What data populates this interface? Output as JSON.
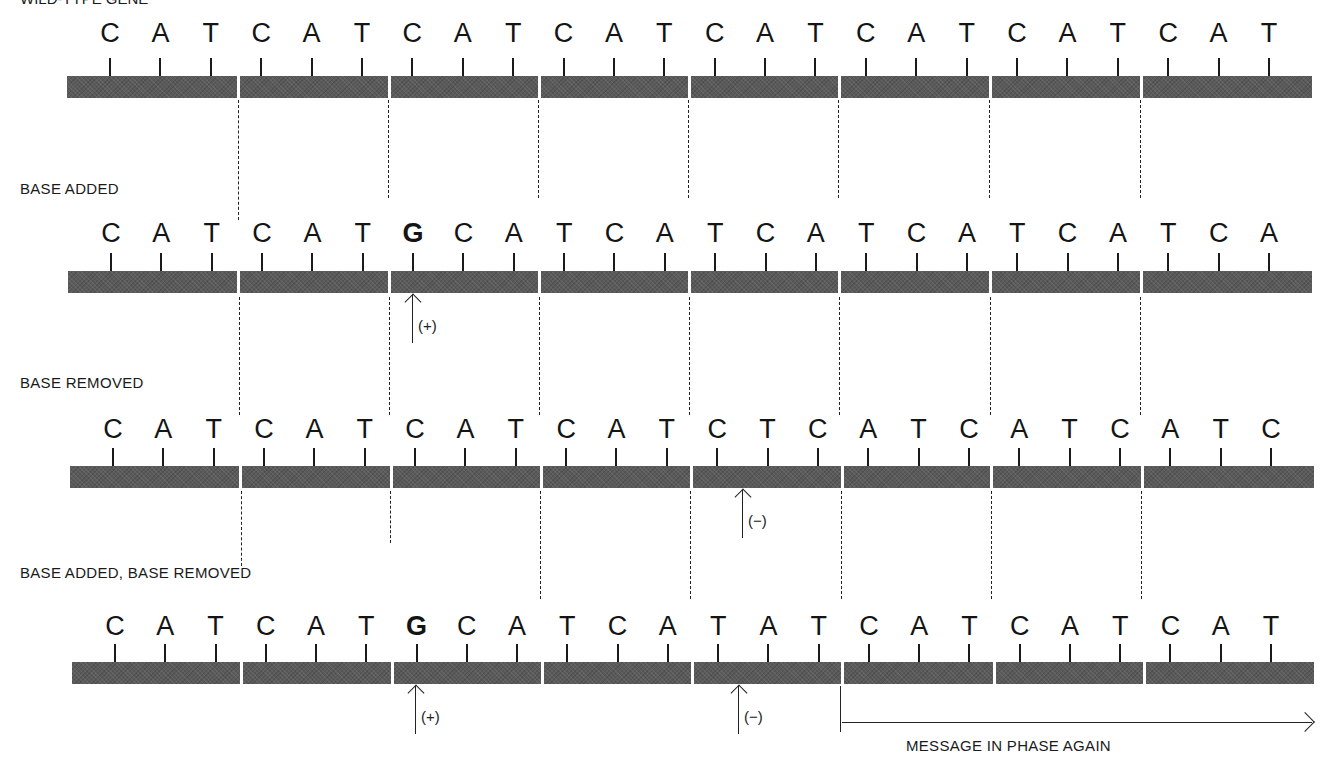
{
  "figure": {
    "title_cropped": "WILD-TYPE GENE",
    "rows": [
      {
        "label": "",
        "sequence": [
          "C",
          "A",
          "T",
          "C",
          "A",
          "T",
          "C",
          "A",
          "T",
          "C",
          "A",
          "T",
          "C",
          "A",
          "T",
          "C",
          "A",
          "T",
          "C",
          "A",
          "T",
          "C",
          "A",
          "T"
        ],
        "bold_indices": [],
        "bar": {
          "x": 67,
          "y": 76,
          "width": 1245
        },
        "dividers_x": [
          237,
          388,
          538,
          688,
          838,
          989,
          1140
        ],
        "base_y": 20
      },
      {
        "label": "BASE ADDED",
        "sequence": [
          "C",
          "A",
          "T",
          "C",
          "A",
          "T",
          "G",
          "C",
          "A",
          "T",
          "C",
          "A",
          "T",
          "C",
          "A",
          "T",
          "C",
          "A",
          "T",
          "C",
          "A",
          "T",
          "C",
          "A"
        ],
        "bold_indices": [
          6
        ],
        "bar": {
          "x": 68,
          "y": 271,
          "width": 1244
        },
        "dividers_x": [
          237,
          388,
          538,
          688,
          838,
          989,
          1140
        ],
        "base_y": 220,
        "markers": [
          {
            "type": "insertion",
            "symbol": "(+)",
            "x": 412
          }
        ]
      },
      {
        "label": "BASE REMOVED",
        "sequence": [
          "C",
          "A",
          "T",
          "C",
          "A",
          "T",
          "C",
          "A",
          "T",
          "C",
          "A",
          "T",
          "C",
          "T",
          "C",
          "A",
          "T",
          "C",
          "A",
          "T",
          "C",
          "A",
          "T",
          "C"
        ],
        "bold_indices": [],
        "bar": {
          "x": 70,
          "y": 466,
          "width": 1244
        },
        "dividers_x": [
          239,
          390,
          540,
          690,
          841,
          990,
          1141
        ],
        "base_y": 416,
        "markers": [
          {
            "type": "deletion",
            "symbol": "(−)",
            "x": 742
          }
        ]
      },
      {
        "label": "BASE ADDED, BASE REMOVED",
        "sequence": [
          "C",
          "A",
          "T",
          "C",
          "A",
          "T",
          "G",
          "C",
          "A",
          "T",
          "C",
          "A",
          "T",
          "A",
          "T",
          "C",
          "A",
          "T",
          "C",
          "A",
          "T",
          "C",
          "A",
          "T"
        ],
        "bold_indices": [
          6
        ],
        "bar": {
          "x": 72,
          "y": 662,
          "width": 1242
        },
        "dividers_x": [
          240,
          391,
          541,
          691,
          841,
          993,
          1143
        ],
        "base_y": 613,
        "markers": [
          {
            "type": "insertion",
            "symbol": "(+)",
            "x": 415
          },
          {
            "type": "deletion",
            "symbol": "(−)",
            "x": 738
          }
        ]
      }
    ],
    "in_phase_caption": "MESSAGE IN PHASE AGAIN",
    "colors": {
      "bar": "#5a5a5a",
      "ink": "#1a1a1a",
      "background": "#ffffff"
    }
  }
}
